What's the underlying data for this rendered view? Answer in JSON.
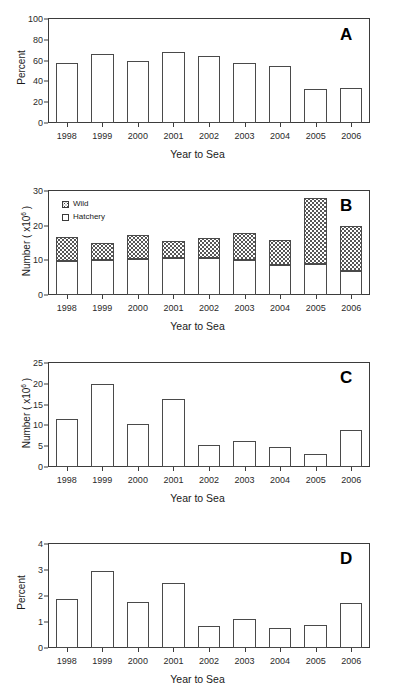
{
  "figure": {
    "partial_top_text": "",
    "x_axis_label": "Year to Sea",
    "categories": [
      "1998",
      "1999",
      "2000",
      "2001",
      "2002",
      "2003",
      "2004",
      "2005",
      "2006"
    ]
  },
  "panels": [
    {
      "letter": "A",
      "ylabel": "Percent",
      "ylabel_sup": "",
      "xlabel": "Year to Sea",
      "ticks": [
        "0",
        "20",
        "40",
        "60",
        "80",
        "100"
      ]
    },
    {
      "letter": "B",
      "ylabel": "Number ( x10",
      "ylabel_sup": "6",
      "ylabel_tail": " )",
      "xlabel": "Year to Sea",
      "ticks": [
        "0",
        "10",
        "20",
        "30"
      ],
      "legend": [
        {
          "label": "Wild",
          "pattern": "dotted"
        },
        {
          "label": "Hatchery",
          "pattern": "open"
        }
      ]
    },
    {
      "letter": "C",
      "ylabel": "Number ( x10",
      "ylabel_sup": "6",
      "ylabel_tail": " )",
      "xlabel": "Year to Sea",
      "ticks": [
        "0",
        "5",
        "10",
        "15",
        "20",
        "25"
      ]
    },
    {
      "letter": "D",
      "ylabel": "Percent",
      "ylabel_sup": "",
      "xlabel": "Year to Sea",
      "ticks": [
        "0",
        "1",
        "2",
        "3",
        "4"
      ]
    }
  ],
  "chart_data": [
    {
      "type": "bar",
      "panel": "A",
      "title": "",
      "xlabel": "Year to Sea",
      "ylabel": "Percent",
      "categories": [
        "1998",
        "1999",
        "2000",
        "2001",
        "2002",
        "2003",
        "2004",
        "2005",
        "2006"
      ],
      "values": [
        58,
        66.5,
        60,
        68,
        64,
        58,
        55,
        33,
        34
      ],
      "ylim": [
        0,
        100
      ],
      "yticks": [
        0,
        20,
        40,
        60,
        80,
        100
      ],
      "grid": false,
      "legend": "none"
    },
    {
      "type": "bar",
      "panel": "B",
      "title": "",
      "xlabel": "Year to Sea",
      "ylabel": "Number ( x10^6 )",
      "categories": [
        "1998",
        "1999",
        "2000",
        "2001",
        "2002",
        "2003",
        "2004",
        "2005",
        "2006"
      ],
      "stacked": true,
      "series": [
        {
          "name": "Hatchery",
          "values": [
            9.9,
            10.2,
            10.4,
            10.7,
            10.8,
            10.2,
            8.8,
            9.0,
            7.0
          ]
        },
        {
          "name": "Wild",
          "values": [
            6.7,
            4.7,
            6.9,
            4.8,
            5.6,
            7.6,
            7.2,
            19.0,
            13.0
          ]
        }
      ],
      "totals": [
        16.6,
        14.9,
        17.3,
        15.5,
        16.4,
        17.8,
        16.0,
        28.0,
        20.0
      ],
      "ylim": [
        0,
        30
      ],
      "yticks": [
        0,
        10,
        20,
        30
      ],
      "grid": false,
      "legend": "upper-left"
    },
    {
      "type": "bar",
      "panel": "C",
      "title": "",
      "xlabel": "Year to Sea",
      "ylabel": "Number ( x10^6 )",
      "categories": [
        "1998",
        "1999",
        "2000",
        "2001",
        "2002",
        "2003",
        "2004",
        "2005",
        "2006"
      ],
      "values": [
        11.5,
        19.9,
        10.4,
        16.4,
        5.2,
        6.2,
        4.8,
        3.2,
        9.0
      ],
      "ylim": [
        0,
        25
      ],
      "yticks": [
        0,
        5,
        10,
        15,
        20,
        25
      ],
      "grid": false,
      "legend": "none"
    },
    {
      "type": "bar",
      "panel": "D",
      "title": "",
      "xlabel": "Year to Sea",
      "ylabel": "Percent",
      "categories": [
        "1998",
        "1999",
        "2000",
        "2001",
        "2002",
        "2003",
        "2004",
        "2005",
        "2006"
      ],
      "values": [
        1.9,
        2.95,
        1.77,
        2.5,
        0.85,
        1.1,
        0.78,
        0.88,
        1.75
      ],
      "ylim": [
        0,
        4
      ],
      "yticks": [
        0,
        1,
        2,
        3,
        4
      ],
      "grid": false,
      "legend": "none"
    }
  ],
  "colors": {
    "bar_outline": "#4a4a4a",
    "bar_fill": "#ffffff",
    "axis": "#3b3b3b",
    "text": "#1a1a1a",
    "wild_pattern": "#4a4a4a"
  }
}
